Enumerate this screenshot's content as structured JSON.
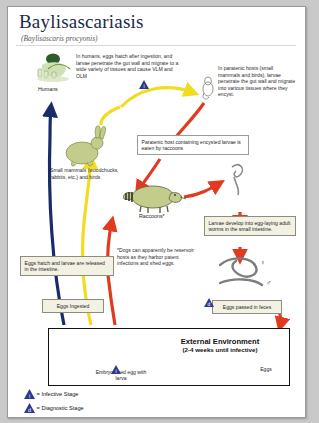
{
  "document": {
    "title": "Baylisascariasis",
    "scientific_name": "(Baylisascaris procyonis)",
    "type": "parasite-life-cycle-diagram"
  },
  "annotations": {
    "humans_text": "In humans, eggs hatch after ingestion, and larvae penetrate the gut wall and migrate to a wide variety of tissues and cause VLM and OLM",
    "humans_label": "Humans",
    "paratenic_text": "In paratenic hosts (small mammals and birds), larvae penetrate the gut wall and migrate into various tissues where they encyst.",
    "paratenic_eaten_box": "Paratenic host containing encysted larvae is eaten by raccoons",
    "small_mammals_label": "Small mammals (woodchucks, rabbits, etc.) and birds",
    "raccoons_label": "Raccoons*",
    "larvae_develop_box": "Larvae develop into egg-laying adult worms in the small intestine.",
    "eggs_hatch_box": "Eggs hatch and larvae are released in the intestine.",
    "eggs_ingested_box": "Eggs Ingested",
    "dogs_note": "*Dogs can apparently be reservoir hosts as they harbor patent infections and shed eggs.",
    "eggs_passed_box": "Eggs passed in feces"
  },
  "external_environment": {
    "title": "External Environment",
    "subtitle": "(2-4 weeks until infective)",
    "embryonated_label": "Embryonated egg with larva",
    "eggs_label": "Eggs"
  },
  "worm_symbols": {
    "female": "♀",
    "male": "♂"
  },
  "legend": [
    {
      "marker": "i",
      "label": "= Infective Stage"
    },
    {
      "marker": "d",
      "label": "= Diagnostic Stage"
    }
  ],
  "colors": {
    "infective_triangle": "#2b3a8f",
    "diagnostic_triangle": "#2b3a8f",
    "red_arrow": "#e03a20",
    "yellow_arrow": "#f4e02a",
    "blue_arrow": "#1b2a6b",
    "animal_fill": "#c3cc8a",
    "title": "#1b2a4a",
    "callout_bg": "#f2f1e4"
  }
}
